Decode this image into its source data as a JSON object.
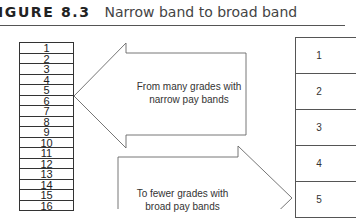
{
  "figure": {
    "label": "IGURE 8.3",
    "caption": "Narrow band to broad band"
  },
  "left_column": {
    "grades": [
      "1",
      "2",
      "3",
      "4",
      "5",
      "6",
      "7",
      "8",
      "9",
      "10",
      "11",
      "12",
      "13",
      "14",
      "15",
      "16"
    ]
  },
  "right_column": {
    "bands": [
      "1",
      "2",
      "3",
      "4",
      "5"
    ]
  },
  "arrows": {
    "top": {
      "direction": "left",
      "line1": "From many grades with",
      "line2": "narrow pay bands"
    },
    "bottom": {
      "direction": "right",
      "line1": "To fewer grades with",
      "line2": "broad pay bands"
    }
  },
  "colors": {
    "line": "#555555",
    "text": "#333333",
    "background": "#ffffff"
  }
}
